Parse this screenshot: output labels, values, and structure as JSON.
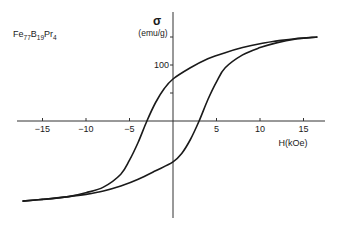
{
  "chart_data": {
    "type": "line",
    "title": "",
    "annotation": {
      "base": "Fe",
      "parts": [
        [
          "Fe",
          "77"
        ],
        [
          "B",
          "19"
        ],
        [
          "Pr",
          "4"
        ]
      ]
    },
    "xlabel": "H(kOe)",
    "ylabel": "σ",
    "ylabel_unit": "(emu/g)",
    "xlim": [
      -18,
      17
    ],
    "ylim": [
      -175,
      205
    ],
    "xticks": [
      -15,
      -10,
      -5,
      5,
      10,
      15
    ],
    "xtick_labels": [
      "−15",
      "−10",
      "−5",
      "5",
      "10",
      "15"
    ],
    "yticks": [
      50,
      100,
      150
    ],
    "ytick_labels": [
      "",
      "100",
      ""
    ],
    "grid": false,
    "legend": "none",
    "series": [
      {
        "name": "descending-branch",
        "x": [
          16.6,
          14,
          12,
          10,
          8,
          6,
          4,
          2,
          0,
          -1,
          -2,
          -3,
          -4,
          -5,
          -6,
          -8,
          -10,
          -12,
          -15,
          -17.3
        ],
        "y": [
          150,
          147,
          143,
          138,
          131,
          122,
          111,
          95,
          75,
          58,
          33,
          0,
          -38,
          -70,
          -95,
          -118,
          -128,
          -135,
          -140,
          -143
        ]
      },
      {
        "name": "ascending-branch",
        "x": [
          -17.3,
          -15,
          -12,
          -10,
          -8,
          -6,
          -4,
          -2,
          0,
          1,
          2,
          3,
          4,
          5,
          6,
          8,
          10,
          12,
          14,
          16.6
        ],
        "y": [
          -143,
          -140,
          -135,
          -131,
          -125,
          -116,
          -104,
          -89,
          -73,
          -58,
          -33,
          0,
          38,
          70,
          95,
          118,
          131,
          140,
          146,
          150
        ]
      }
    ]
  }
}
